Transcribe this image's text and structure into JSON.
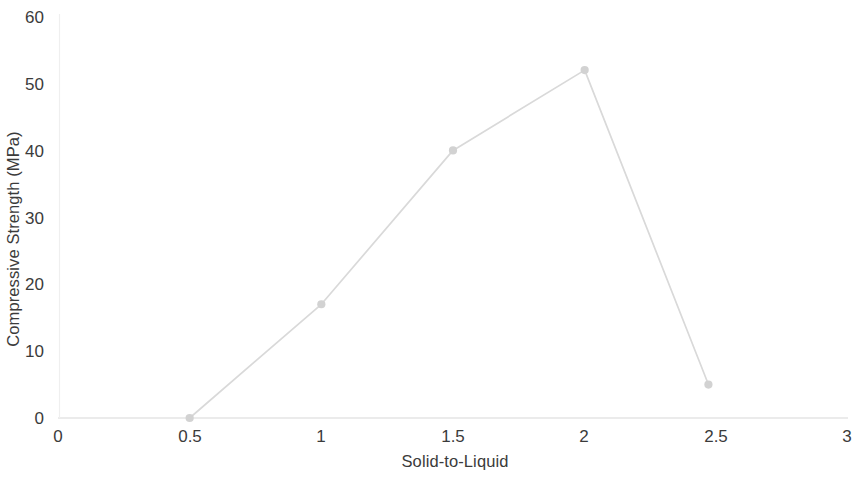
{
  "chart_data": {
    "type": "line",
    "title": "",
    "xlabel": "Solid-to-Liquid",
    "ylabel": "Compressive Strength (MPa)",
    "x": [
      0.5,
      1,
      1.5,
      2,
      2.47
    ],
    "values": [
      0,
      17,
      40,
      52,
      5
    ],
    "series": [
      {
        "name": "Compressive Strength",
        "x": [
          0.5,
          1,
          1.5,
          2,
          2.47
        ],
        "values": [
          0,
          17,
          40,
          52,
          5
        ]
      }
    ],
    "xlim": [
      0,
      3
    ],
    "ylim": [
      0,
      60
    ],
    "xticks": [
      "0",
      "0.5",
      "1",
      "1.5",
      "2",
      "2.5",
      "3"
    ],
    "xtick_values": [
      0,
      0.5,
      1,
      1.5,
      2,
      2.5,
      3
    ],
    "yticks": [
      "0",
      "10",
      "20",
      "30",
      "40",
      "50",
      "60"
    ],
    "ytick_values": [
      0,
      10,
      20,
      30,
      40,
      50,
      60
    ],
    "grid": false,
    "legend": false,
    "markers": "circle",
    "line_color": "#d9d9d9",
    "marker_color": "#d2d2d2",
    "axis_color": "#e3e3e3",
    "text_color": "#3b3b3b"
  }
}
